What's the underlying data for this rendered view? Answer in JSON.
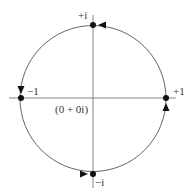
{
  "diagram": {
    "center_label": "(0 + 0i)",
    "points": [
      {
        "id": "plus-i",
        "label": "+i"
      },
      {
        "id": "minus-one",
        "label": "−1"
      },
      {
        "id": "minus-i",
        "label": "−i"
      },
      {
        "id": "plus-one",
        "label": "+1"
      }
    ],
    "direction": "counterclockwise",
    "colors": {
      "stroke": "#555555",
      "dot": "#111111",
      "text": "#333333"
    }
  }
}
